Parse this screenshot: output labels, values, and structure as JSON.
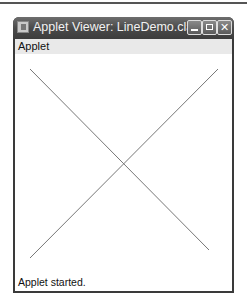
{
  "window": {
    "title": "Applet Viewer: LineDemo.class",
    "controls": {
      "minimize": "minimize",
      "maximize": "maximize",
      "close": "✕"
    }
  },
  "menubar": {
    "items": [
      {
        "label": "Applet"
      }
    ]
  },
  "canvas": {
    "lines": [
      {
        "x1": 15,
        "y1": 15,
        "x2": 194,
        "y2": 196,
        "color": "#777777"
      },
      {
        "x1": 203,
        "y1": 15,
        "x2": 15,
        "y2": 204,
        "color": "#777777"
      }
    ]
  },
  "status": {
    "text": "Applet started."
  }
}
